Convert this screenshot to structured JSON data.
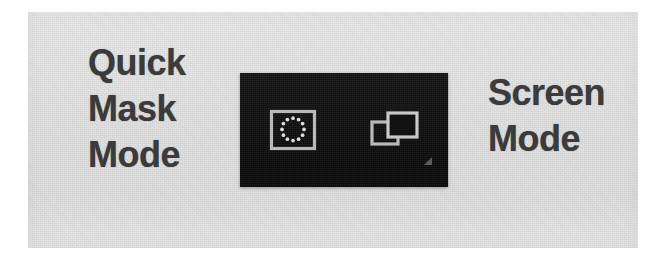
{
  "screenshot": {
    "kind": "photoshop-toolbar-closeup",
    "background_color": "#ffffff",
    "surface_color": "#e3e3e3"
  },
  "toolbar": {
    "background_color": "#121212",
    "icon_color": "#b9b9b9",
    "buttons": [
      {
        "id": "quick-mask",
        "icon": "quick-mask-icon",
        "label": "Quick Mask Mode",
        "state": "off"
      },
      {
        "id": "screen-mode",
        "icon": "screen-mode-icon",
        "label": "Screen Mode",
        "has_flyout": true
      }
    ]
  },
  "annotations": {
    "left": {
      "name": "quick-mask-mode-caption",
      "text": "Quick Mask Mode",
      "lines": [
        "Quick",
        "Mask",
        "Mode"
      ],
      "color": "#3b3b3b"
    },
    "right": {
      "name": "screen-mode-caption",
      "text": "Screen Mode",
      "lines": [
        "Screen",
        "Mode"
      ],
      "color": "#3b3b3b"
    }
  }
}
